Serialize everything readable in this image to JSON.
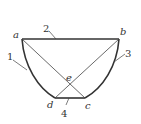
{
  "figure": {
    "type": "geometric-diagram",
    "stroke_color": "#333333",
    "background": "#ffffff"
  },
  "points": {
    "a": {
      "label": "a",
      "x": 22,
      "y": 39
    },
    "b": {
      "label": "b",
      "x": 119,
      "y": 39
    },
    "c": {
      "label": "c",
      "x": 85,
      "y": 98
    },
    "d": {
      "label": "d",
      "x": 55,
      "y": 98
    },
    "e": {
      "label": "e",
      "x": 69,
      "y": 84
    }
  },
  "parts": [
    {
      "number": "1",
      "refers_to": "left curved side"
    },
    {
      "number": "2",
      "refers_to": "top edge ab"
    },
    {
      "number": "3",
      "refers_to": "right curved side"
    },
    {
      "number": "4",
      "refers_to": "bottom edge dc"
    }
  ]
}
